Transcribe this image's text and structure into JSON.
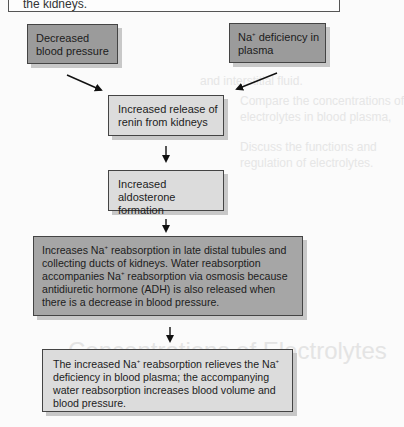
{
  "top_box": {
    "text": "the kidneys."
  },
  "background": {
    "lines": [
      "Compare the concentrations of",
      "electrolytes in blood plasma,",
      "and interstitial fluid.",
      "Discuss the functions and",
      "regulation of electrolytes."
    ],
    "heading_line1": "Concentrations of Electrolytes",
    "heading_line2": "in Body Fluids"
  },
  "diagram": {
    "nodes": [
      {
        "id": "decreased_bp",
        "text": "Decreased blood pressure"
      },
      {
        "id": "na_deficiency",
        "text_pre": "Na",
        "sup": "+",
        "text_post": " deficiency in plasma"
      },
      {
        "id": "renin",
        "text": "Increased release of renin from kidneys"
      },
      {
        "id": "aldosterone",
        "text": "Increased aldosterone formation"
      },
      {
        "id": "reabsorption",
        "parts": [
          "Increases Na",
          "+",
          " reabsorption in late distal tubules and collecting ducts of kidneys. Water reabsorption accompanies Na",
          "+",
          " reabsorption via osmosis because antidiuretic hormone (ADH) is also released when there is a decrease in blood pressure."
        ]
      },
      {
        "id": "result",
        "parts": [
          "The increased Na",
          "+",
          " reabsorption relieves the Na",
          "+",
          " deficiency in blood plasma; the accompanying water reabsorption increases blood volume and blood pressure."
        ]
      }
    ],
    "edges": [
      [
        "decreased_bp",
        "renin"
      ],
      [
        "na_deficiency",
        "renin"
      ],
      [
        "renin",
        "aldosterone"
      ],
      [
        "aldosterone",
        "reabsorption"
      ],
      [
        "reabsorption",
        "result"
      ]
    ],
    "colors": {
      "dark_box": "#9b9b9b",
      "mid_box": "#a6a6a6",
      "light_box": "#dcdcdc",
      "shadow": "#c8c8c8"
    }
  }
}
